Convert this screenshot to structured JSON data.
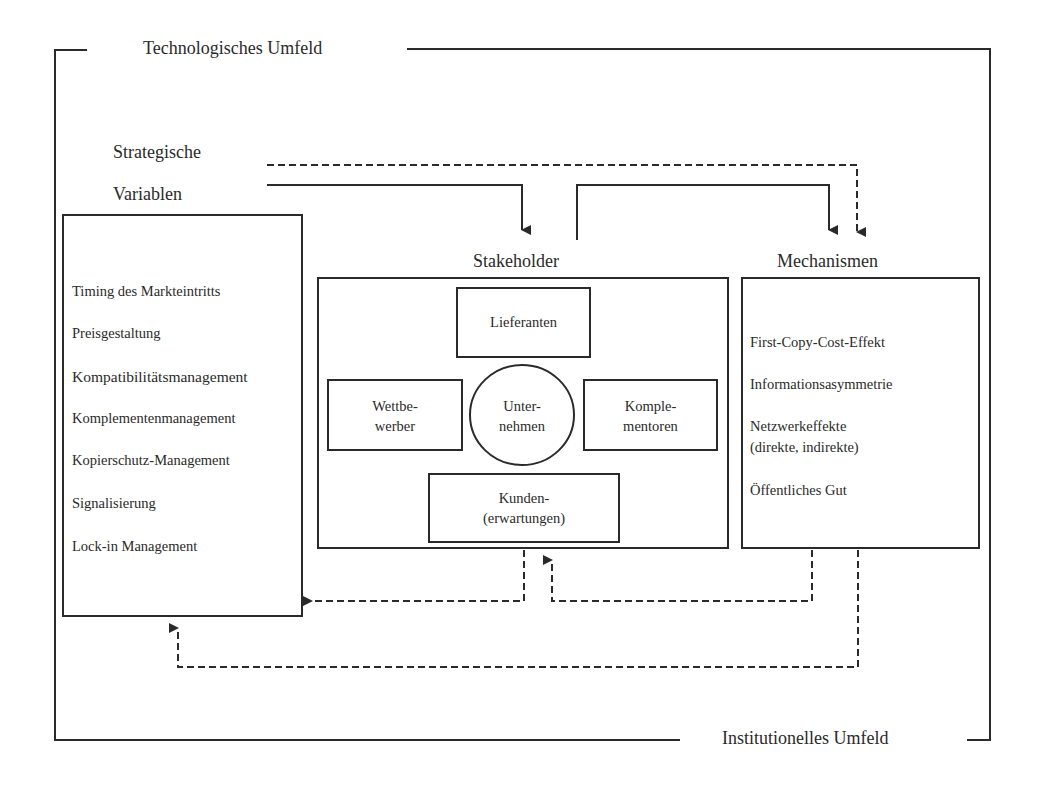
{
  "environment": {
    "technological": "Technologisches Umfeld",
    "institutional": "Institutionelles Umfeld"
  },
  "strategic_variables": {
    "title_line1": "Strategische",
    "title_line2": "Variablen",
    "items": [
      "Timing des Markteintritts",
      "Preisgestaltung",
      "Kompatibilitätsmanagement",
      "Komplementenmanagement",
      "Kopierschutz-Management",
      "Signalisierung",
      "Lock-in Management"
    ]
  },
  "stakeholder": {
    "title": "Stakeholder",
    "suppliers": "Lieferanten",
    "competitors_line1": "Wettbe-",
    "competitors_line2": "werber",
    "company_line1": "Unter-",
    "company_line2": "nehmen",
    "complementors_line1": "Komple-",
    "complementors_line2": "mentoren",
    "customers_line1": "Kunden-",
    "customers_line2": "(erwartungen)"
  },
  "mechanisms": {
    "title": "Mechanismen",
    "items": [
      "First-Copy-Cost-Effekt",
      "Informationsasymmetrie",
      "Netzwerkeffekte",
      "(direkte, indirekte)",
      "Öffentliches Gut"
    ]
  },
  "colors": {
    "line": "#2a2a2a",
    "background": "#ffffff"
  }
}
